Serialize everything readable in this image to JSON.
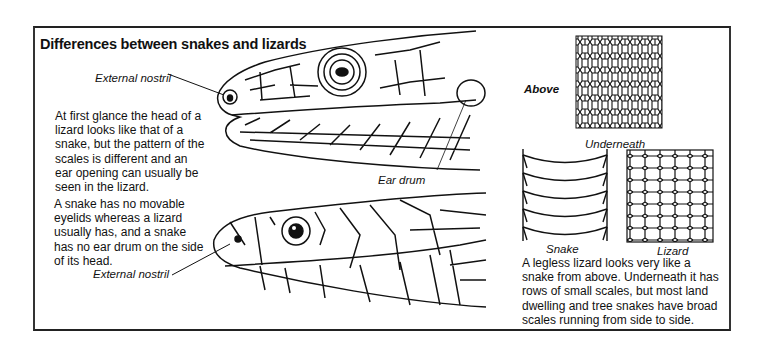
{
  "title": "Differences between snakes and lizards",
  "labels": {
    "lizard_nostril": "External nostril",
    "ear_drum": "Ear drum",
    "snake_nostril": "External nostril",
    "above": "Above",
    "underneath": "Underneath",
    "snake": "Snake",
    "lizard": "Lizard"
  },
  "paragraphs": {
    "head_pattern": [
      "At first glance the head of a",
      "lizard looks like that of a",
      "snake, but the pattern of the",
      "scales is different and an",
      "ear opening can usually be",
      "seen in the lizard."
    ],
    "eyelids": [
      "A snake has no movable",
      "eyelids whereas a lizard",
      "usually has, and a snake",
      "has no ear drum on the side",
      "of its head."
    ],
    "legless": [
      "A legless lizard looks very like a",
      "snake from above. Underneath it has",
      "rows of small scales, but most land",
      "dwelling and tree snakes have broad",
      "scales running from side to side."
    ]
  }
}
